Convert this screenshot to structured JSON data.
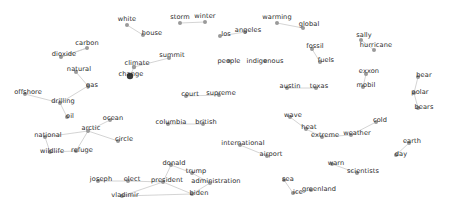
{
  "chart_data": {
    "type": "scatter",
    "title": "",
    "subtitle": "",
    "xlabel": "",
    "ylabel": "",
    "xlim": [
      0,
      449
    ],
    "ylim": [
      0,
      217
    ],
    "grid": false,
    "legend": null,
    "node_color": "#9a9a9a",
    "hub_color": "#3a3a3a",
    "edge_color": "#c9c9c9",
    "label_color": "#2b2b2b",
    "background_color": "#ffffff",
    "nodes": [
      {
        "id": "white",
        "label": "white",
        "x": 127,
        "y": 25,
        "lx": 127,
        "ly": 19,
        "r": 2.0,
        "hub": false
      },
      {
        "id": "house",
        "label": "house",
        "x": 143,
        "y": 35,
        "lx": 152,
        "ly": 33,
        "r": 2.0,
        "hub": false
      },
      {
        "id": "storm",
        "label": "storm",
        "x": 180,
        "y": 23,
        "lx": 180,
        "ly": 17,
        "r": 2.0,
        "hub": false
      },
      {
        "id": "winter",
        "label": "winter",
        "x": 205,
        "y": 22,
        "lx": 205,
        "ly": 16,
        "r": 2.0,
        "hub": false
      },
      {
        "id": "warming",
        "label": "warming",
        "x": 277,
        "y": 23,
        "lx": 277,
        "ly": 17,
        "r": 2.0,
        "hub": false
      },
      {
        "id": "global",
        "label": "global",
        "x": 303,
        "y": 28,
        "lx": 309,
        "ly": 24,
        "r": 2.0,
        "hub": false
      },
      {
        "id": "sally",
        "label": "sally",
        "x": 361,
        "y": 40,
        "lx": 364,
        "ly": 35,
        "r": 2.0,
        "hub": false
      },
      {
        "id": "hurricane",
        "label": "hurricane",
        "x": 374,
        "y": 50,
        "lx": 376,
        "ly": 45,
        "r": 2.0,
        "hub": false
      },
      {
        "id": "carbon",
        "label": "carbon",
        "x": 87,
        "y": 48,
        "lx": 87,
        "ly": 43,
        "r": 2.0,
        "hub": false
      },
      {
        "id": "dioxide",
        "label": "dioxide",
        "x": 61,
        "y": 57,
        "lx": 64,
        "ly": 54,
        "r": 2.0,
        "hub": false
      },
      {
        "id": "los",
        "label": "los",
        "x": 220,
        "y": 36,
        "lx": 226,
        "ly": 34,
        "r": 2.0,
        "hub": false
      },
      {
        "id": "angeles",
        "label": "angeles",
        "x": 245,
        "y": 32,
        "lx": 248,
        "ly": 30,
        "r": 2.0,
        "hub": false
      },
      {
        "id": "fossil",
        "label": "fossil",
        "x": 312,
        "y": 49,
        "lx": 315,
        "ly": 46,
        "r": 2.0,
        "hub": false
      },
      {
        "id": "fuels",
        "label": "fuels",
        "x": 320,
        "y": 62,
        "lx": 326,
        "ly": 60,
        "r": 2.0,
        "hub": false
      },
      {
        "id": "summit",
        "label": "summit",
        "x": 169,
        "y": 58,
        "lx": 172,
        "ly": 55,
        "r": 2.0,
        "hub": false
      },
      {
        "id": "climate",
        "label": "climate",
        "x": 134,
        "y": 67,
        "lx": 137,
        "ly": 63,
        "r": 2.2,
        "hub": false
      },
      {
        "id": "change",
        "label": "change",
        "x": 130,
        "y": 76,
        "lx": 131,
        "ly": 74,
        "r": 3.2,
        "hub": true
      },
      {
        "id": "people",
        "label": "people",
        "x": 229,
        "y": 61,
        "lx": 229,
        "ly": 61,
        "r": 2.0,
        "hub": false
      },
      {
        "id": "indigenous",
        "label": "indigenous",
        "x": 265,
        "y": 61,
        "lx": 265,
        "ly": 61,
        "r": 2.0,
        "hub": false
      },
      {
        "id": "natural",
        "label": "natural",
        "x": 76,
        "y": 72,
        "lx": 79,
        "ly": 69,
        "r": 2.0,
        "hub": false
      },
      {
        "id": "gas",
        "label": "gas",
        "x": 88,
        "y": 86,
        "lx": 92,
        "ly": 85,
        "r": 2.0,
        "hub": false
      },
      {
        "id": "exxon",
        "label": "exxon",
        "x": 366,
        "y": 74,
        "lx": 369,
        "ly": 71,
        "r": 2.0,
        "hub": false
      },
      {
        "id": "mobil",
        "label": "mobil",
        "x": 363,
        "y": 87,
        "lx": 366,
        "ly": 85,
        "r": 2.0,
        "hub": false
      },
      {
        "id": "bear",
        "label": "bear",
        "x": 418,
        "y": 77,
        "lx": 424,
        "ly": 75,
        "r": 2.0,
        "hub": false
      },
      {
        "id": "polar",
        "label": "polar",
        "x": 414,
        "y": 93,
        "lx": 420,
        "ly": 92,
        "r": 2.0,
        "hub": false
      },
      {
        "id": "bears",
        "label": "bears",
        "x": 418,
        "y": 108,
        "lx": 424,
        "ly": 107,
        "r": 2.0,
        "hub": false
      },
      {
        "id": "offshore",
        "label": "offshore",
        "x": 25,
        "y": 94,
        "lx": 28,
        "ly": 92,
        "r": 2.0,
        "hub": false
      },
      {
        "id": "drilling",
        "label": "drilling",
        "x": 60,
        "y": 103,
        "lx": 63,
        "ly": 101,
        "r": 2.0,
        "hub": false
      },
      {
        "id": "court",
        "label": "court",
        "x": 186,
        "y": 96,
        "lx": 190,
        "ly": 94,
        "r": 2.0,
        "hub": false
      },
      {
        "id": "supreme",
        "label": "supreme",
        "x": 219,
        "y": 95,
        "lx": 221,
        "ly": 93,
        "r": 2.0,
        "hub": false
      },
      {
        "id": "austin",
        "label": "austin",
        "x": 287,
        "y": 88,
        "lx": 290,
        "ly": 86,
        "r": 2.0,
        "hub": false
      },
      {
        "id": "texas",
        "label": "texas",
        "x": 316,
        "y": 88,
        "lx": 319,
        "ly": 86,
        "r": 2.0,
        "hub": false
      },
      {
        "id": "oil",
        "label": "oil",
        "x": 67,
        "y": 117,
        "lx": 70,
        "ly": 116,
        "r": 2.0,
        "hub": false
      },
      {
        "id": "arctic",
        "label": "arctic",
        "x": 88,
        "y": 131,
        "lx": 91,
        "ly": 128,
        "r": 2.0,
        "hub": false
      },
      {
        "id": "national",
        "label": "national",
        "x": 45,
        "y": 137,
        "lx": 48,
        "ly": 135,
        "r": 2.0,
        "hub": false
      },
      {
        "id": "wildlife",
        "label": "wildlife",
        "x": 50,
        "y": 152,
        "lx": 52,
        "ly": 151,
        "r": 2.0,
        "hub": false
      },
      {
        "id": "refuge",
        "label": "refuge",
        "x": 76,
        "y": 151,
        "lx": 82,
        "ly": 150,
        "r": 2.0,
        "hub": false
      },
      {
        "id": "ocean",
        "label": "ocean",
        "x": 110,
        "y": 120,
        "lx": 113,
        "ly": 118,
        "r": 2.0,
        "hub": false
      },
      {
        "id": "circle",
        "label": "circle",
        "x": 118,
        "y": 141,
        "lx": 124,
        "ly": 139,
        "r": 2.0,
        "hub": false
      },
      {
        "id": "columbia",
        "label": "columbia",
        "x": 168,
        "y": 124,
        "lx": 171,
        "ly": 122,
        "r": 2.0,
        "hub": false
      },
      {
        "id": "british",
        "label": "british",
        "x": 203,
        "y": 124,
        "lx": 206,
        "ly": 122,
        "r": 2.0,
        "hub": false
      },
      {
        "id": "wave",
        "label": "wave",
        "x": 290,
        "y": 117,
        "lx": 293,
        "ly": 115,
        "r": 2.0,
        "hub": false
      },
      {
        "id": "heat",
        "label": "heat",
        "x": 306,
        "y": 129,
        "lx": 309,
        "ly": 127,
        "r": 2.0,
        "hub": false
      },
      {
        "id": "extreme",
        "label": "extreme",
        "x": 322,
        "y": 137,
        "lx": 325,
        "ly": 135,
        "r": 2.0,
        "hub": false
      },
      {
        "id": "weather",
        "label": "weather",
        "x": 351,
        "y": 135,
        "lx": 357,
        "ly": 133,
        "r": 2.0,
        "hub": false
      },
      {
        "id": "cold",
        "label": "cold",
        "x": 376,
        "y": 122,
        "lx": 380,
        "ly": 120,
        "r": 2.0,
        "hub": false
      },
      {
        "id": "earth",
        "label": "earth",
        "x": 409,
        "y": 143,
        "lx": 412,
        "ly": 141,
        "r": 2.0,
        "hub": false
      },
      {
        "id": "day",
        "label": "day",
        "x": 396,
        "y": 155,
        "lx": 401,
        "ly": 154,
        "r": 2.0,
        "hub": false
      },
      {
        "id": "international",
        "label": "international",
        "x": 240,
        "y": 145,
        "lx": 243,
        "ly": 143,
        "r": 2.0,
        "hub": false
      },
      {
        "id": "airport",
        "label": "airport",
        "x": 267,
        "y": 156,
        "lx": 271,
        "ly": 154,
        "r": 2.0,
        "hub": false
      },
      {
        "id": "donald",
        "label": "donald",
        "x": 171,
        "y": 165,
        "lx": 174,
        "ly": 163,
        "r": 2.0,
        "hub": false
      },
      {
        "id": "trump",
        "label": "trump",
        "x": 192,
        "y": 173,
        "lx": 196,
        "ly": 171,
        "r": 2.0,
        "hub": false
      },
      {
        "id": "joseph",
        "label": "joseph",
        "x": 98,
        "y": 181,
        "lx": 101,
        "ly": 179,
        "r": 2.0,
        "hub": false
      },
      {
        "id": "elect",
        "label": "elect",
        "x": 128,
        "y": 181,
        "lx": 132,
        "ly": 179,
        "r": 2.0,
        "hub": false
      },
      {
        "id": "president",
        "label": "president",
        "x": 163,
        "y": 182,
        "lx": 167,
        "ly": 180,
        "r": 2.0,
        "hub": false
      },
      {
        "id": "administration",
        "label": "administration",
        "x": 210,
        "y": 183,
        "lx": 216,
        "ly": 181,
        "r": 2.0,
        "hub": false
      },
      {
        "id": "vladimir",
        "label": "vladimir",
        "x": 122,
        "y": 196,
        "lx": 125,
        "ly": 195,
        "r": 2.0,
        "hub": false
      },
      {
        "id": "biden",
        "label": "biden",
        "x": 192,
        "y": 194,
        "lx": 199,
        "ly": 193,
        "r": 2.0,
        "hub": false
      },
      {
        "id": "sea",
        "label": "sea",
        "x": 284,
        "y": 180,
        "lx": 288,
        "ly": 179,
        "r": 2.0,
        "hub": false
      },
      {
        "id": "ice",
        "label": "ice",
        "x": 293,
        "y": 193,
        "lx": 298,
        "ly": 192,
        "r": 2.0,
        "hub": false
      },
      {
        "id": "greenland",
        "label": "greenland",
        "x": 311,
        "y": 190,
        "lx": 319,
        "ly": 189,
        "r": 2.0,
        "hub": false
      },
      {
        "id": "warn",
        "label": "warn",
        "x": 332,
        "y": 164,
        "lx": 336,
        "ly": 163,
        "r": 2.0,
        "hub": false
      },
      {
        "id": "scientists",
        "label": "scientists",
        "x": 357,
        "y": 173,
        "lx": 363,
        "ly": 171,
        "r": 2.0,
        "hub": false
      }
    ],
    "edges": [
      {
        "source": "white",
        "target": "house"
      },
      {
        "source": "warming",
        "target": "global"
      },
      {
        "source": "sally",
        "target": "hurricane"
      },
      {
        "source": "carbon",
        "target": "dioxide"
      },
      {
        "source": "los",
        "target": "angeles"
      },
      {
        "source": "fossil",
        "target": "fuels"
      },
      {
        "source": "climate",
        "target": "change"
      },
      {
        "source": "summit",
        "target": "climate"
      },
      {
        "source": "natural",
        "target": "gas"
      },
      {
        "source": "exxon",
        "target": "mobil"
      },
      {
        "source": "bear",
        "target": "polar"
      },
      {
        "source": "polar",
        "target": "bears"
      },
      {
        "source": "offshore",
        "target": "drilling"
      },
      {
        "source": "court",
        "target": "supreme"
      },
      {
        "source": "austin",
        "target": "texas"
      },
      {
        "source": "oil",
        "target": "drilling"
      },
      {
        "source": "national",
        "target": "arctic"
      },
      {
        "source": "national",
        "target": "wildlife"
      },
      {
        "source": "wildlife",
        "target": "refuge"
      },
      {
        "source": "arctic",
        "target": "circle"
      },
      {
        "source": "arctic",
        "target": "ocean"
      },
      {
        "source": "columbia",
        "target": "british"
      },
      {
        "source": "wave",
        "target": "heat"
      },
      {
        "source": "heat",
        "target": "extreme"
      },
      {
        "source": "extreme",
        "target": "weather"
      },
      {
        "source": "weather",
        "target": "cold"
      },
      {
        "source": "earth",
        "target": "day"
      },
      {
        "source": "international",
        "target": "airport"
      },
      {
        "source": "donald",
        "target": "trump"
      },
      {
        "source": "trump",
        "target": "administration"
      },
      {
        "source": "president",
        "target": "donald"
      },
      {
        "source": "president",
        "target": "elect"
      },
      {
        "source": "president",
        "target": "vladimir"
      },
      {
        "source": "president",
        "target": "biden"
      },
      {
        "source": "joseph",
        "target": "elect"
      },
      {
        "source": "biden",
        "target": "administration"
      },
      {
        "source": "vladimir",
        "target": "biden"
      },
      {
        "source": "sea",
        "target": "ice"
      },
      {
        "source": "ice",
        "target": "greenland"
      },
      {
        "source": "warn",
        "target": "scientists"
      },
      {
        "source": "storm",
        "target": "winter"
      },
      {
        "source": "dioxide",
        "target": "carbon"
      },
      {
        "source": "gas",
        "target": "drilling"
      },
      {
        "source": "refuge",
        "target": "arctic"
      }
    ]
  }
}
